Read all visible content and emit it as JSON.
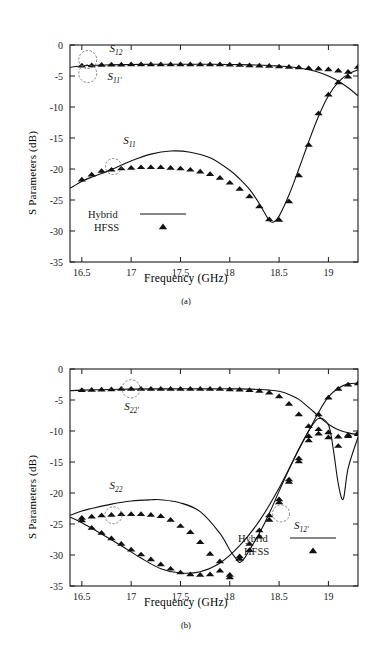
{
  "figure": {
    "panels": [
      {
        "id": "a",
        "caption": "(a)",
        "xlabel": "Frequency (GHz)",
        "ylabel": "S Parameters (dB)",
        "legend": {
          "line_label": "Hybrid",
          "marker_label": "HFSS"
        },
        "annotations": [
          {
            "name": "s12",
            "base": "S",
            "sub": "12",
            "x": 16.78,
            "y": -1.1,
            "circle_x": 16.56,
            "circle_y": -2.35,
            "circle_r": 9
          },
          {
            "name": "s11p",
            "base": "S",
            "sub": "11'",
            "x": 16.76,
            "y": -5.6,
            "circle_x": 16.56,
            "circle_y": -4.6,
            "circle_r": 9
          },
          {
            "name": "s11",
            "base": "S",
            "sub": "11",
            "x": 16.92,
            "y": -15.9,
            "circle_x": 16.82,
            "circle_y": -19.6,
            "circle_r": 8
          }
        ],
        "chart_data": {
          "type": "line",
          "title": "",
          "xlabel": "Frequency (GHz)",
          "ylabel": "S Parameters (dB)",
          "xlim": [
            16.38,
            19.3
          ],
          "ylim": [
            -35,
            0
          ],
          "xticks": [
            16.5,
            17,
            17.5,
            18,
            18.5,
            19
          ],
          "yticks": [
            0,
            -5,
            -10,
            -15,
            -20,
            -25,
            -30,
            -35
          ],
          "grid": false,
          "legend_position": "lower-left",
          "series": [
            {
              "name": "S12 Hybrid",
              "style": "line",
              "x": [
                16.38,
                16.5,
                16.6,
                16.7,
                16.8,
                17.0,
                17.2,
                17.4,
                17.6,
                17.8,
                18.0,
                18.2,
                18.4,
                18.5,
                18.6,
                18.7,
                18.8,
                18.9,
                19.0,
                19.1,
                19.2,
                19.3
              ],
              "y": [
                -3.6,
                -3.35,
                -3.3,
                -3.25,
                -3.2,
                -3.15,
                -3.1,
                -3.1,
                -3.1,
                -3.1,
                -3.15,
                -3.2,
                -3.3,
                -3.4,
                -3.5,
                -3.7,
                -4.0,
                -4.4,
                -5.0,
                -5.8,
                -6.9,
                -8.2
              ]
            },
            {
              "name": "S12 HFSS",
              "style": "markers",
              "x": [
                16.5,
                16.6,
                16.7,
                16.8,
                16.9,
                17.0,
                17.1,
                17.2,
                17.3,
                17.4,
                17.5,
                17.6,
                17.7,
                17.8,
                17.9,
                18.0,
                18.1,
                18.2,
                18.3,
                18.4,
                18.5,
                18.6,
                18.7,
                18.8,
                18.9,
                19.0,
                19.1,
                19.2,
                19.3
              ],
              "y": [
                -3.3,
                -3.25,
                -3.2,
                -3.15,
                -3.15,
                -3.1,
                -3.1,
                -3.1,
                -3.1,
                -3.1,
                -3.1,
                -3.1,
                -3.1,
                -3.1,
                -3.1,
                -3.15,
                -3.2,
                -3.25,
                -3.3,
                -3.35,
                -3.45,
                -3.5,
                -3.6,
                -3.7,
                -3.8,
                -3.9,
                -4.1,
                -4.3,
                -3.5
              ]
            },
            {
              "name": "S11 Hybrid",
              "style": "line",
              "x": [
                16.38,
                16.5,
                16.6,
                16.8,
                17.0,
                17.2,
                17.4,
                17.6,
                17.8,
                18.0,
                18.1,
                18.2,
                18.3,
                18.4,
                18.45,
                18.5,
                18.6,
                18.7,
                18.8,
                18.9,
                19.0,
                19.1,
                19.2,
                19.3
              ],
              "y": [
                -23.1,
                -22.0,
                -21.3,
                -20.1,
                -18.7,
                -17.6,
                -17.1,
                -17.3,
                -18.2,
                -20.2,
                -21.6,
                -23.3,
                -25.6,
                -28.3,
                -28.5,
                -27.6,
                -24.2,
                -20.0,
                -15.6,
                -11.5,
                -8.2,
                -6.0,
                -4.7,
                -4.0
              ]
            },
            {
              "name": "S11 HFSS",
              "style": "markers",
              "x": [
                16.5,
                16.6,
                16.7,
                16.8,
                16.9,
                17.0,
                17.1,
                17.2,
                17.3,
                17.4,
                17.5,
                17.6,
                17.7,
                17.8,
                17.9,
                18.0,
                18.1,
                18.2,
                18.3,
                18.4,
                18.5,
                18.6,
                18.7,
                18.8,
                18.9,
                19.0,
                19.1,
                19.2
              ],
              "y": [
                -21.7,
                -20.9,
                -20.3,
                -20.1,
                -19.9,
                -19.8,
                -19.7,
                -19.7,
                -19.7,
                -19.8,
                -19.9,
                -20.1,
                -20.4,
                -20.8,
                -21.4,
                -22.2,
                -23.2,
                -24.4,
                -26.0,
                -28.1,
                -28.2,
                -25.2,
                -21.0,
                -16.1,
                -11.0,
                -8.0,
                -6.0,
                -5.1
              ]
            }
          ]
        }
      },
      {
        "id": "b",
        "caption": "(b)",
        "xlabel": "Frequency (GHz)",
        "ylabel": "S Parameters (dB)",
        "legend": {
          "line_label": "Hybrid",
          "marker_label": "HFSS"
        },
        "annotations": [
          {
            "name": "s22p",
            "base": "S",
            "sub": "22'",
            "x": 16.93,
            "y": -6.6,
            "circle_x": 17.0,
            "circle_y": -3.2,
            "circle_r": 9
          },
          {
            "name": "s22",
            "base": "S",
            "sub": "22",
            "x": 16.78,
            "y": -19.4,
            "circle_x": 16.82,
            "circle_y": -23.6,
            "circle_r": 8.5
          },
          {
            "name": "s12p",
            "base": "S",
            "sub": "12'",
            "x": 18.65,
            "y": -25.8,
            "circle_x": 18.52,
            "circle_y": -23.3,
            "circle_r": 8.5
          }
        ],
        "chart_data": {
          "type": "line",
          "title": "",
          "xlabel": "Frequency (GHz)",
          "ylabel": "S Parameters (dB)",
          "xlim": [
            16.38,
            19.3
          ],
          "ylim": [
            -35,
            0
          ],
          "xticks": [
            16.5,
            17,
            17.5,
            18,
            18.5,
            19
          ],
          "yticks": [
            0,
            -5,
            -10,
            -15,
            -20,
            -25,
            -30,
            -35
          ],
          "grid": false,
          "legend_position": "lower-right",
          "series": [
            {
              "name": "S22' Hybrid",
              "style": "line",
              "x": [
                16.38,
                16.5,
                16.8,
                17.0,
                17.4,
                17.8,
                18.0,
                18.2,
                18.3,
                18.4,
                18.5,
                18.6,
                18.7,
                18.8,
                18.9,
                19.0,
                19.1,
                19.2,
                19.3
              ],
              "y": [
                -3.5,
                -3.4,
                -3.3,
                -3.25,
                -3.2,
                -3.2,
                -3.2,
                -3.25,
                -3.3,
                -3.4,
                -3.6,
                -4.1,
                -4.9,
                -6.2,
                -7.6,
                -8.9,
                -9.8,
                -10.3,
                -10.6
              ]
            },
            {
              "name": "S22' HFSS",
              "style": "markers",
              "x": [
                16.5,
                16.6,
                16.7,
                16.8,
                16.9,
                17.0,
                17.1,
                17.2,
                17.3,
                17.4,
                17.5,
                17.6,
                17.7,
                17.8,
                17.9,
                18.0,
                18.1,
                18.2,
                18.3,
                18.4,
                18.5,
                18.6,
                18.7,
                18.8,
                18.9,
                19.0,
                19.1,
                19.2,
                19.3
              ],
              "y": [
                -3.4,
                -3.35,
                -3.3,
                -3.25,
                -3.2,
                -3.2,
                -3.2,
                -3.2,
                -3.2,
                -3.2,
                -3.2,
                -3.2,
                -3.2,
                -3.2,
                -3.2,
                -3.25,
                -3.3,
                -3.4,
                -3.5,
                -3.8,
                -4.4,
                -5.6,
                -7.3,
                -9.2,
                -10.4,
                -11.0,
                -10.9,
                -10.6,
                -10.3
              ]
            },
            {
              "name": "S22 Hybrid",
              "style": "line",
              "x": [
                16.38,
                16.5,
                16.6,
                16.8,
                17.0,
                17.2,
                17.3,
                17.5,
                17.7,
                17.9,
                18.0,
                18.05,
                18.1,
                18.15,
                18.2,
                18.3,
                18.4,
                18.5,
                18.6,
                18.7,
                18.8,
                18.9,
                19.0,
                19.05,
                19.1,
                19.15,
                19.2,
                19.3
              ],
              "y": [
                -23.6,
                -22.9,
                -22.5,
                -21.8,
                -21.3,
                -21.1,
                -21.1,
                -21.6,
                -23.0,
                -26.5,
                -29.2,
                -30.3,
                -31.2,
                -30.5,
                -29.2,
                -26.5,
                -23.3,
                -19.7,
                -16.2,
                -12.9,
                -10.0,
                -8.0,
                -9.0,
                -13.0,
                -18.5,
                -21.0,
                -16.0,
                -11.0
              ]
            },
            {
              "name": "S22 HFSS",
              "style": "markers",
              "x": [
                16.5,
                16.6,
                16.7,
                16.8,
                16.9,
                17.0,
                17.1,
                17.2,
                17.3,
                17.4,
                17.5,
                17.6,
                17.7,
                17.8,
                17.9,
                18.0,
                18.1,
                18.2,
                18.3,
                18.4,
                18.5,
                18.6,
                18.7,
                18.8,
                18.9,
                19.0,
                19.1,
                19.2,
                19.3
              ],
              "y": [
                -24.0,
                -23.8,
                -23.6,
                -23.5,
                -23.4,
                -23.4,
                -23.4,
                -23.5,
                -23.7,
                -24.3,
                -25.3,
                -26.3,
                -27.9,
                -29.8,
                -31.0,
                -33.2,
                -30.6,
                -29.2,
                -27.0,
                -24.3,
                -21.5,
                -18.2,
                -14.9,
                -11.5,
                -9.7,
                -10.2,
                -12.4,
                -10.8,
                -10.5
              ]
            },
            {
              "name": "S12' Hybrid",
              "style": "line",
              "x": [
                16.38,
                16.5,
                16.7,
                16.9,
                17.1,
                17.3,
                17.5,
                17.7,
                17.9,
                18.1,
                18.3,
                18.5,
                18.7,
                18.9,
                19.0,
                19.1,
                19.2,
                19.3
              ],
              "y": [
                -23.9,
                -24.8,
                -26.6,
                -28.5,
                -30.5,
                -32.2,
                -32.9,
                -32.7,
                -31.3,
                -28.5,
                -24.5,
                -19.2,
                -13.0,
                -7.0,
                -4.5,
                -3.1,
                -2.4,
                -2.3
              ]
            },
            {
              "name": "S12' HFSS",
              "style": "markers",
              "x": [
                16.5,
                16.6,
                16.7,
                16.8,
                16.9,
                17.0,
                17.1,
                17.2,
                17.3,
                17.4,
                17.5,
                17.6,
                17.7,
                17.8,
                17.9,
                18.0,
                18.1,
                18.2,
                18.3,
                18.4,
                18.5,
                18.6,
                18.7,
                18.8,
                18.9,
                19.0,
                19.1,
                19.2,
                19.3
              ],
              "y": [
                -24.4,
                -25.6,
                -26.4,
                -27.3,
                -28.2,
                -29.1,
                -29.9,
                -30.7,
                -31.5,
                -32.2,
                -32.8,
                -33.1,
                -33.2,
                -33.1,
                -32.5,
                -33.6,
                -30.2,
                -28.2,
                -26.0,
                -23.6,
                -21.0,
                -17.8,
                -14.4,
                -10.8,
                -7.3,
                -4.6,
                -3.2,
                -2.5,
                -2.3
              ]
            }
          ]
        }
      }
    ]
  }
}
